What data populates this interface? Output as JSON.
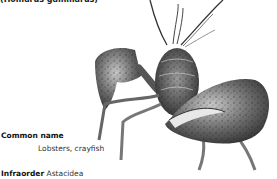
{
  "caption": {
    "species_name": "(Homarus gammarus)"
  },
  "illustration": {
    "subject": "lobster-illustration",
    "style": "grayscale engraving"
  },
  "facts": {
    "common_name": {
      "label": "Common name",
      "value": "Lobsters, crayfish"
    },
    "infraorder": {
      "label": "Infraorder",
      "value": "Astacidea"
    }
  }
}
